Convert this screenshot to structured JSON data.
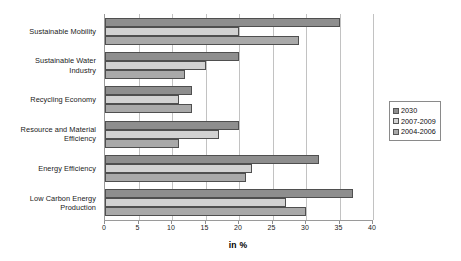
{
  "chart_data": {
    "type": "bar",
    "orientation": "horizontal",
    "title": "",
    "subtitle": "",
    "xlabel": "in %",
    "ylabel": "",
    "xlim": [
      0,
      40
    ],
    "xticks": [
      0,
      5,
      10,
      15,
      20,
      25,
      30,
      35,
      40
    ],
    "xticklabels": [
      "0",
      "5",
      "10",
      "15",
      "20",
      "25",
      "30",
      "35",
      "40"
    ],
    "grid": "vertical",
    "legend_position": "right",
    "categories": [
      "Sustainable Mobility",
      "Sustainable Water Industry",
      "Recycling Economy",
      "Resource and Material Efficiency",
      "Energy Efficiency",
      "Low Carbon Energy Production"
    ],
    "category_lines": [
      [
        "Sustainable Mobility"
      ],
      [
        "Sustainable Water",
        "Industry"
      ],
      [
        "Recycling Economy"
      ],
      [
        "Resource and Material",
        "Efficiency"
      ],
      [
        "Energy Efficiency"
      ],
      [
        "Low Carbon Energy",
        "Production"
      ]
    ],
    "series": [
      {
        "name": "2030",
        "color": "#8e8e8e",
        "values": [
          35,
          20,
          13,
          20,
          32,
          37
        ]
      },
      {
        "name": "2007-2009",
        "color": "#d2d2d2",
        "values": [
          20,
          15,
          11,
          17,
          22,
          27
        ]
      },
      {
        "name": "2004-2006",
        "color": "#a9a9a9",
        "values": [
          29,
          12,
          13,
          11,
          21,
          30
        ]
      }
    ]
  },
  "legend": {
    "items": [
      {
        "label": "2030",
        "color": "#8e8e8e"
      },
      {
        "label": "2007-2009",
        "color": "#d2d2d2"
      },
      {
        "label": "2004-2006",
        "color": "#a9a9a9"
      }
    ]
  },
  "axis": {
    "x_title": "in %"
  }
}
